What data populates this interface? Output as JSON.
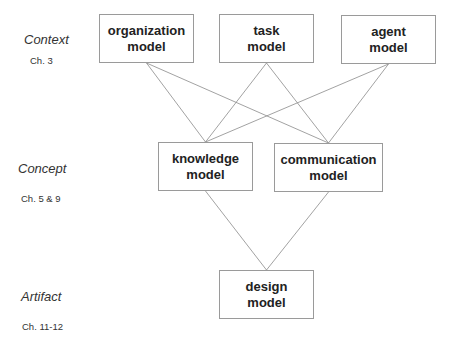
{
  "levels": [
    {
      "name": "Context",
      "chapters": "Ch. 3"
    },
    {
      "name": "Concept",
      "chapters": "Ch. 5 & 9"
    },
    {
      "name": "Artifact",
      "chapters": "Ch. 11-12"
    }
  ],
  "models": {
    "organization": {
      "line1": "organization",
      "line2": "model"
    },
    "task": {
      "line1": "task",
      "line2": "model"
    },
    "agent": {
      "line1": "agent",
      "line2": "model"
    },
    "knowledge": {
      "line1": "knowledge",
      "line2": "model"
    },
    "communication": {
      "line1": "communication",
      "line2": "model"
    },
    "design": {
      "line1": "design",
      "line2": "model"
    }
  },
  "links": [
    [
      "organization",
      "knowledge"
    ],
    [
      "organization",
      "communication"
    ],
    [
      "task",
      "knowledge"
    ],
    [
      "task",
      "communication"
    ],
    [
      "agent",
      "knowledge"
    ],
    [
      "agent",
      "communication"
    ],
    [
      "knowledge",
      "design"
    ],
    [
      "communication",
      "design"
    ]
  ]
}
